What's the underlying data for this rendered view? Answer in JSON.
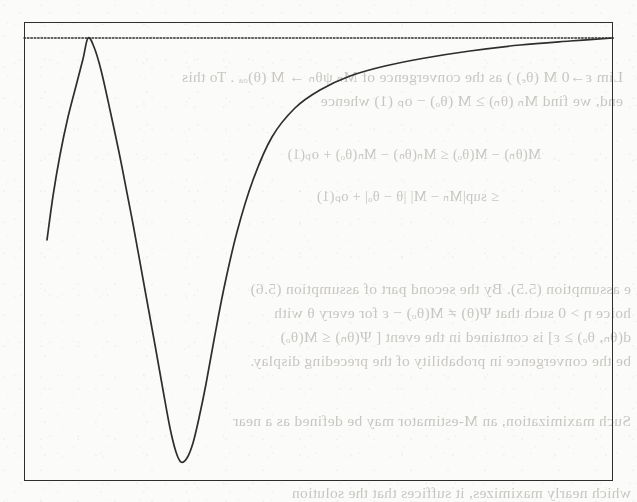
{
  "figure": {
    "kind": "scanned-page-figure",
    "frame": {
      "x": 24,
      "y": 22,
      "width": 589,
      "height": 459
    },
    "ink_color": "#2e2e2e",
    "paper_color": "#fbfbfa",
    "bleed_text_color": "#9a968f"
  },
  "chart_data": {
    "type": "line",
    "title": "",
    "subtitle": "",
    "xlabel": "",
    "ylabel": "",
    "grid": false,
    "legend_position": "none",
    "axis_ticks": {
      "x": [],
      "y": []
    },
    "xlim": [
      24,
      613
    ],
    "ylim": [
      481,
      22
    ],
    "annotations": [],
    "series": [
      {
        "name": "asymptote",
        "style": "dotted",
        "linewidth": 1.4,
        "color": "#2e2e2e",
        "x": [
          24,
          613
        ],
        "y": [
          38,
          38
        ]
      },
      {
        "name": "curve",
        "style": "solid",
        "linewidth": 1.7,
        "color": "#2e2e2e",
        "x": [
          47,
          53,
          60,
          68,
          76,
          83,
          88,
          94,
          101,
          110,
          121,
          133,
          145,
          155,
          163,
          170,
          176,
          181,
          187,
          193,
          199,
          206,
          214,
          224,
          237,
          253,
          272,
          295,
          320,
          350,
          385,
          425,
          470,
          520,
          570,
          613
        ],
        "y": [
          240,
          196,
          155,
          117,
          86,
          59,
          38,
          47,
          70,
          110,
          162,
          224,
          290,
          345,
          390,
          428,
          452,
          462,
          458,
          443,
          418,
          384,
          340,
          288,
          232,
          180,
          137,
          108,
          90,
          76,
          66,
          58,
          51,
          45,
          41,
          38
        ]
      }
    ],
    "features": {
      "peak": {
        "x": 88,
        "y": 38,
        "touches_asymptote": true
      },
      "trough": {
        "x": 181,
        "y": 462
      },
      "curve_start": {
        "x": 47,
        "y": 240
      },
      "curve_end": {
        "x": 613,
        "y": 38
      }
    }
  },
  "bleed_text": {
    "note": "faint reversed show-through text from the opposite side of the scanned page",
    "lines": [
      {
        "text": "Lim ε→0 M (θₑ) ) as the convergence of Mₙ ψθₙ → M (θ)ₒₐ . To this",
        "x": 14,
        "y": 68,
        "size": 15.5
      },
      {
        "text": "end, we find Mₙ (θₙ) ≥ M (θₒ) − oₚ (1) whence",
        "x": 14,
        "y": 92,
        "size": 15.5
      },
      {
        "text": "M(θₙ) − M(θₒ) ≤ Mₙ(θₙ) − Mₙ(θₒ) + oₚ(1)",
        "x": 96,
        "y": 146,
        "size": 14.5
      },
      {
        "text": "≤ sup|Mₙ − M| |θ − θₒ| + oₚ(1)",
        "x": 138,
        "y": 188,
        "size": 14.5
      },
      {
        "text": "e assumption (5.5). By the second part of assumption (5.6)",
        "x": 6,
        "y": 280,
        "size": 15.5
      },
      {
        "text": "hoice η > 0 such that Ψ(θ) ≠ M(θₒ) − ε for every θ with",
        "x": 6,
        "y": 304,
        "size": 15.5
      },
      {
        "text": "d(θₙ, θₒ) ≥ ε] is contained in the event [ Ψ(θₙ) ≤ M(θₒ)",
        "x": 6,
        "y": 328,
        "size": 15.5
      },
      {
        "text": "be the convergence in probability of the preceding display.",
        "x": 6,
        "y": 352,
        "size": 15.5
      },
      {
        "text": "Such maximization, an M-estimator may be defined as a near",
        "x": 6,
        "y": 412,
        "size": 15.5
      },
      {
        "text": "which nearly maximizes, it suffices that the solution",
        "x": 6,
        "y": 484,
        "size": 15.5
      }
    ]
  }
}
